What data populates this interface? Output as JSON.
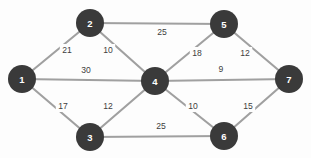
{
  "figure": {
    "type": "weighted-undirected-graph",
    "background_color": "#fdfdfd",
    "node_color": "#3a3a3a",
    "node_label_color": "#ffffff",
    "edge_color": "#a0a0a0",
    "weight_label_color": "#3d3d3d"
  },
  "nodes": [
    {
      "id": "1",
      "label": "1",
      "x": 22,
      "y": 79,
      "r": 14
    },
    {
      "id": "2",
      "label": "2",
      "x": 90,
      "y": 23,
      "r": 14
    },
    {
      "id": "3",
      "label": "3",
      "x": 90,
      "y": 137,
      "r": 14
    },
    {
      "id": "4",
      "label": "4",
      "x": 155,
      "y": 81,
      "r": 14
    },
    {
      "id": "5",
      "label": "5",
      "x": 224,
      "y": 24,
      "r": 14
    },
    {
      "id": "6",
      "label": "6",
      "x": 224,
      "y": 136,
      "r": 14
    },
    {
      "id": "7",
      "label": "7",
      "x": 289,
      "y": 79,
      "r": 14
    }
  ],
  "edges": [
    {
      "from": "1",
      "to": "2",
      "weight": "21",
      "lx": 67,
      "ly": 50
    },
    {
      "from": "1",
      "to": "4",
      "weight": "30",
      "lx": 86,
      "ly": 70
    },
    {
      "from": "1",
      "to": "3",
      "weight": "17",
      "lx": 63,
      "ly": 106
    },
    {
      "from": "2",
      "to": "5",
      "weight": "25",
      "lx": 162,
      "ly": 32
    },
    {
      "from": "2",
      "to": "4",
      "weight": "10",
      "lx": 108,
      "ly": 50
    },
    {
      "from": "3",
      "to": "4",
      "weight": "12",
      "lx": 108,
      "ly": 106
    },
    {
      "from": "3",
      "to": "6",
      "weight": "25",
      "lx": 161,
      "ly": 126
    },
    {
      "from": "4",
      "to": "5",
      "weight": "18",
      "lx": 197,
      "ly": 53
    },
    {
      "from": "4",
      "to": "7",
      "weight": "9",
      "lx": 221,
      "ly": 69
    },
    {
      "from": "4",
      "to": "6",
      "weight": "10",
      "lx": 193,
      "ly": 106
    },
    {
      "from": "5",
      "to": "7",
      "weight": "12",
      "lx": 245,
      "ly": 53
    },
    {
      "from": "6",
      "to": "7",
      "weight": "15",
      "lx": 248,
      "ly": 106
    }
  ]
}
